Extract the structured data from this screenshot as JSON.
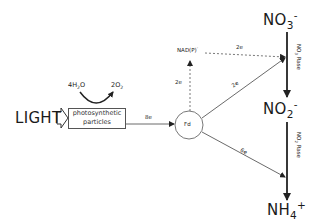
{
  "diagram": {
    "input": {
      "label": "LIGHT"
    },
    "particles": {
      "line1": "photosynthetic",
      "line2": "particles"
    },
    "water_split": {
      "reactant": "4H",
      "reactant_sub": "2",
      "reactant_tail": "O",
      "product": "2O",
      "product_sub": "2"
    },
    "edges": {
      "particles_to_fd": "8e",
      "fd_to_nadp": "2e",
      "nadp_to_no3": "2e",
      "fd_to_no3": "2e",
      "fd_to_no2": "6e"
    },
    "fd": {
      "label": "Fd"
    },
    "nadp": {
      "label": "NAD(P)",
      "charge": "-"
    },
    "no3": {
      "label": "NO",
      "sub": "3",
      "charge": "-"
    },
    "no2": {
      "label": "NO",
      "sub": "2",
      "charge": "-"
    },
    "nh4": {
      "label": "NH",
      "sub": "4",
      "charge": "+"
    },
    "enzymes": {
      "nitrate": {
        "label": "NO",
        "sub": "3",
        "tail": "Rase"
      },
      "nitrite": {
        "label": "NO",
        "sub": "2",
        "tail": "Rase"
      }
    }
  }
}
